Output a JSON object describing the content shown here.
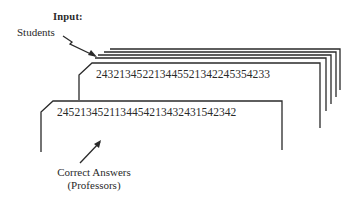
{
  "diagram": {
    "title": "Input:",
    "students_label": "Students",
    "student_card_text": "243213452213445521342245354233",
    "answer_card_text": "2452134521134454213432431542342",
    "correct_answers_label": "Correct Answers",
    "professors_label": "(Professors)",
    "student_card_stack_count": 5,
    "line_color": "#2a2a2a"
  }
}
